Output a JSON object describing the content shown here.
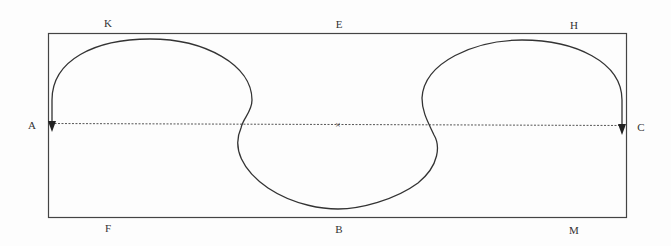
{
  "diagram": {
    "labels": {
      "K": "K",
      "E": "E",
      "H": "H",
      "A": "A",
      "C": "C",
      "F": "F",
      "B": "B",
      "M": "M"
    },
    "colors": {
      "stroke": "#333333",
      "dashed": "#555555",
      "background": "#fdfdfd"
    },
    "center_mark": "×"
  }
}
